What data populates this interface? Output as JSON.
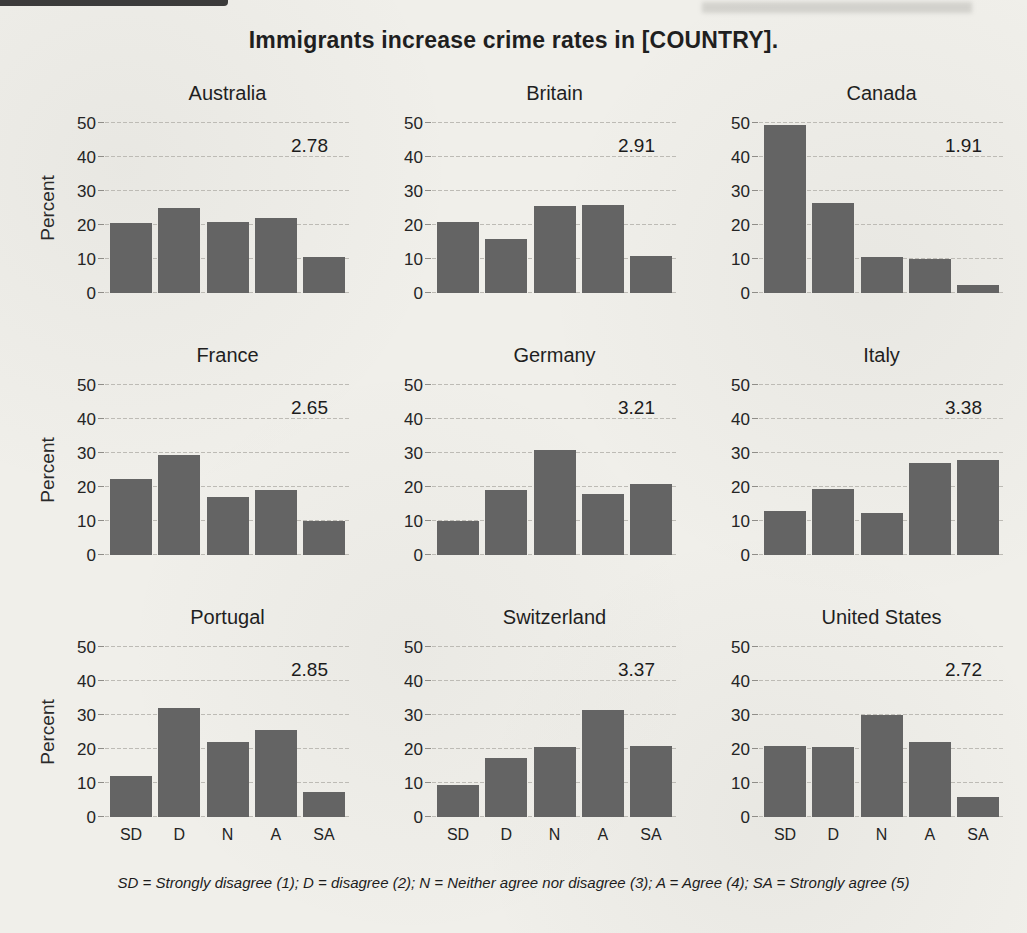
{
  "page": {
    "footnote": "SD = Strongly disagree (1); D = disagree (2); N = Neither agree nor disagree (3); A = Agree (4); SA = Strongly agree (5)"
  },
  "colors": {
    "bar": "#646464",
    "gridline": "#bdbbb5",
    "background": "#f0efea",
    "text": "#1f1f1f"
  },
  "chart_data": {
    "type": "bar",
    "title": "Immigrants increase crime rates in [COUNTRY].",
    "categories": [
      "SD",
      "D",
      "N",
      "A",
      "SA"
    ],
    "ylabel": "Percent",
    "ylim": [
      0,
      50
    ],
    "yticks": [
      0,
      10,
      20,
      30,
      40,
      50
    ],
    "grid": "horizontal gridlines on",
    "legend": "none",
    "note": "SD = Strongly disagree (1); D = disagree (2); N = Neither agree nor disagree (3); A = Agree (4); SA = Strongly agree (5)",
    "panels": [
      {
        "title": "Australia",
        "mean": "2.78",
        "values": [
          20.5,
          25,
          21,
          22,
          10.5
        ]
      },
      {
        "title": "Britain",
        "mean": "2.91",
        "values": [
          21,
          16,
          25.5,
          26,
          11
        ]
      },
      {
        "title": "Canada",
        "mean": "1.91",
        "values": [
          49.5,
          26.5,
          10.5,
          10,
          2.5
        ]
      },
      {
        "title": "France",
        "mean": "2.65",
        "values": [
          22.5,
          29.5,
          17,
          19,
          10
        ]
      },
      {
        "title": "Germany",
        "mean": "3.21",
        "values": [
          10,
          19,
          31,
          18,
          21
        ]
      },
      {
        "title": "Italy",
        "mean": "3.38",
        "values": [
          13,
          19.5,
          12.5,
          27,
          28
        ]
      },
      {
        "title": "Portugal",
        "mean": "2.85",
        "values": [
          12,
          32,
          22,
          25.5,
          7.5
        ]
      },
      {
        "title": "Switzerland",
        "mean": "3.37",
        "values": [
          9.5,
          17.5,
          20.5,
          31.5,
          21
        ]
      },
      {
        "title": "United States",
        "mean": "2.72",
        "values": [
          21,
          20.5,
          30,
          22,
          6
        ]
      }
    ]
  }
}
